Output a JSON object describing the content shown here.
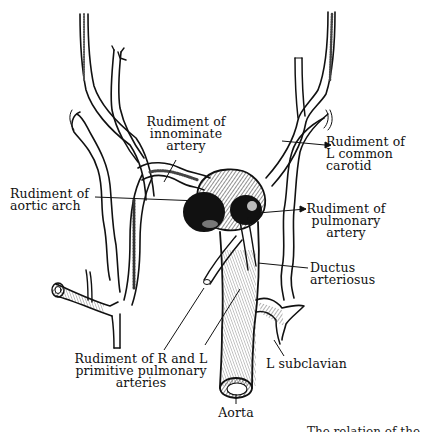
{
  "figure": {
    "type": "anatomical-line-drawing"
  },
  "labels": {
    "innominate": [
      "Rudiment of",
      "innominate",
      "artery"
    ],
    "l_common_carotid": [
      "Rudiment of",
      "L common",
      "carotid"
    ],
    "aortic_arch": [
      "Rudiment of",
      "aortic arch"
    ],
    "pulmonary_artery": [
      "Rudiment of",
      "pulmonary",
      "artery"
    ],
    "ductus": [
      "Ductus",
      "arteriosus"
    ],
    "primitive_pulmonary": [
      "Rudiment of R and L",
      "primitive pulmonary",
      "arteries"
    ],
    "l_subclavian": [
      "L subclavian"
    ],
    "aorta": [
      "Aorta"
    ]
  },
  "caption_partial": "... The relation of the"
}
